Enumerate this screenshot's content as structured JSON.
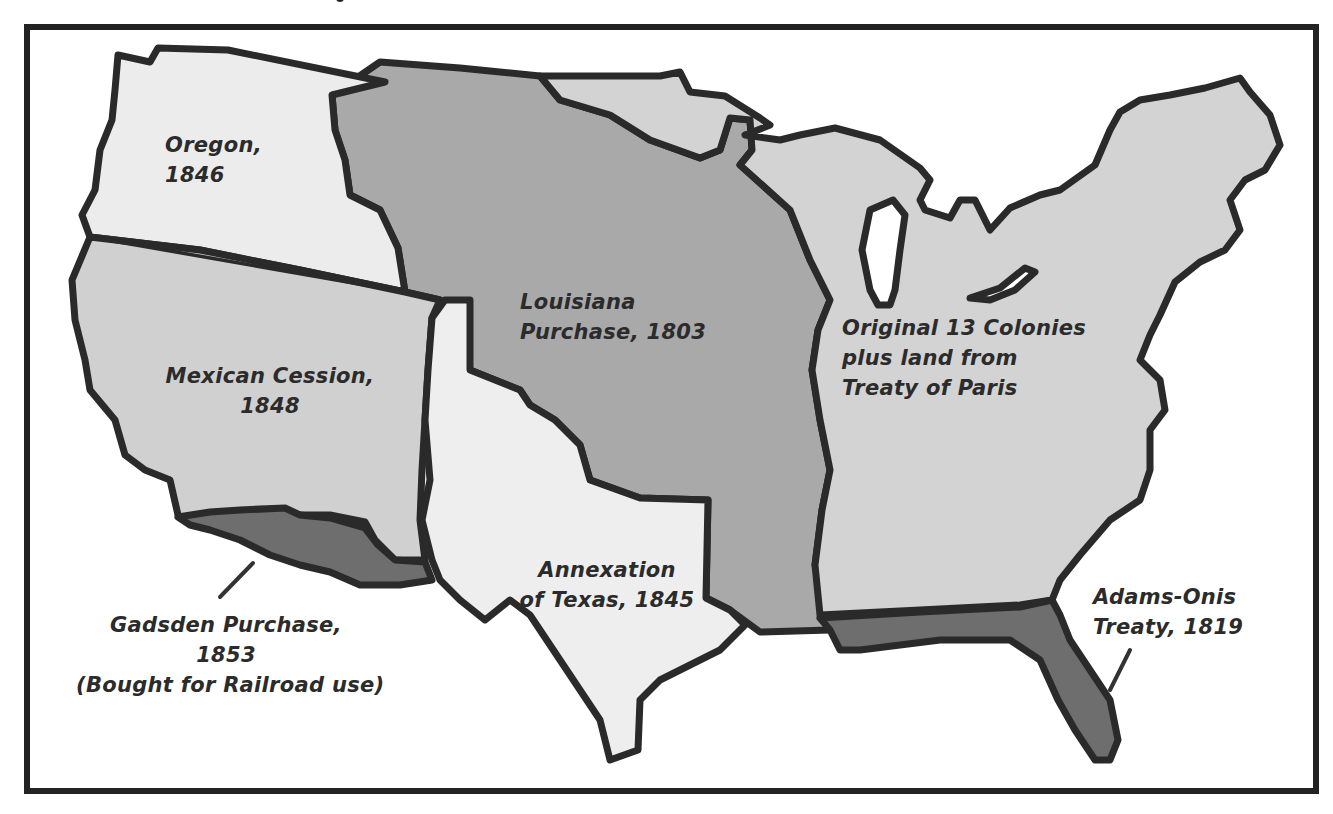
{
  "map": {
    "type": "historical-territorial-map",
    "subject": "United States territorial acquisitions",
    "colors": {
      "frame": "#232323",
      "outline": "#2a2a2a",
      "background": "#ffffff",
      "original_colonies": "#d3d3d3",
      "louisiana_purchase": "#a9a9a9",
      "oregon": "#ececec",
      "mexican_cession": "#d0d0d0",
      "texas": "#eeeeee",
      "gadsden_purchase": "#6e6e6e",
      "adams_onis": "#6e6e6e",
      "text": "#2b2b2b"
    },
    "regions": [
      {
        "id": "oregon",
        "name": "Oregon",
        "year": "1846",
        "label_lines": [
          "Oregon,",
          "1846"
        ]
      },
      {
        "id": "louisiana",
        "name": "Louisiana Purchase",
        "year": "1803",
        "label_lines": [
          "Louisiana",
          "Purchase, 1803"
        ]
      },
      {
        "id": "original",
        "name": "Original 13 Colonies plus land from Treaty of Paris",
        "year": "",
        "label_lines": [
          "Original 13 Colonies",
          "plus land from",
          "Treaty of Paris"
        ]
      },
      {
        "id": "mexican",
        "name": "Mexican Cession",
        "year": "1848",
        "label_lines": [
          "Mexican Cession,",
          "1848"
        ]
      },
      {
        "id": "texas",
        "name": "Annexation of Texas",
        "year": "1845",
        "label_lines": [
          "Annexation",
          "of Texas, 1845"
        ]
      },
      {
        "id": "gadsden",
        "name": "Gadsden Purchase",
        "year": "1853",
        "note": "(Bought for Railroad use)",
        "label_lines": [
          "Gadsden Purchase,",
          "1853",
          "(Bought for Railroad use)"
        ]
      },
      {
        "id": "adams_onis",
        "name": "Adams-Onis Treaty",
        "year": "1819",
        "label_lines": [
          "Adams-Onis",
          "Treaty, 1819"
        ]
      }
    ]
  }
}
